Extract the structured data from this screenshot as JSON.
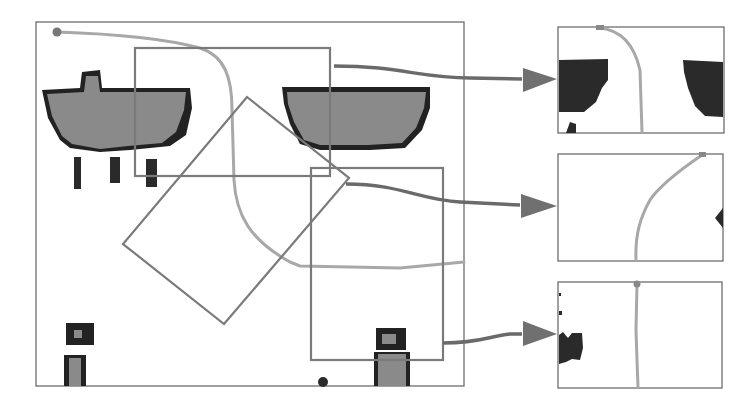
{
  "figure": {
    "colors": {
      "background": "#ffffff",
      "frame": "#6e6e6e",
      "roi_outline": "#7a7a7a",
      "path": "#a8a8a8",
      "arrow": "#6a6a6a",
      "obstacle_fill": "#8a8a8a",
      "obstacle_edge": "#222222"
    },
    "main_map": {
      "label": "global-map",
      "start_marker": "start-point",
      "rois": [
        {
          "id": "roi-1",
          "shape": "axis-aligned-rectangle",
          "target": "inset-1"
        },
        {
          "id": "roi-2",
          "shape": "rotated-rectangle",
          "target": "inset-2"
        },
        {
          "id": "roi-3",
          "shape": "axis-aligned-rectangle",
          "target": "inset-3"
        }
      ]
    },
    "insets": [
      {
        "id": "inset-1",
        "content": "two dark obstacles left and right, path curving down from top"
      },
      {
        "id": "inset-2",
        "content": "path curving from top-right to bottom-center, small obstacle on right edge"
      },
      {
        "id": "inset-3",
        "content": "straight vertical path, obstacle on left edge"
      }
    ],
    "arrows": [
      {
        "from": "roi-1",
        "to": "inset-1"
      },
      {
        "from": "roi-2",
        "to": "inset-2"
      },
      {
        "from": "roi-3",
        "to": "inset-3"
      }
    ]
  }
}
